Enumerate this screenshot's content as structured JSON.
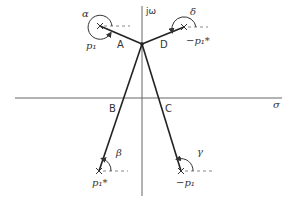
{
  "diagram": {
    "type": "root-locus-angle-construction",
    "axes": {
      "real_label": "σ",
      "imag_label": "jω"
    },
    "points": {
      "A": "A",
      "B": "B",
      "C": "C",
      "D": "D"
    },
    "poles": [
      {
        "id": "upper-left",
        "label": "p₁",
        "angle_label": "α"
      },
      {
        "id": "upper-right",
        "label": "−p₁*",
        "angle_label": "δ"
      },
      {
        "id": "lower-left",
        "label": "p₁*",
        "angle_label": "β"
      },
      {
        "id": "lower-right",
        "label": "−p₁",
        "angle_label": "γ"
      }
    ],
    "colors": {
      "line": "#222222",
      "axis": "#666666",
      "dashed": "#888888"
    }
  }
}
